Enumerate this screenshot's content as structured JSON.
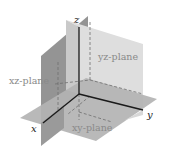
{
  "diagram": {
    "axes": {
      "x": "x",
      "y": "y",
      "z": "z"
    },
    "planes": {
      "xy": "xy-plane",
      "xz": "xz-plane",
      "yz": "yz-plane"
    },
    "colors": {
      "xz_plane": "#8e8e8e",
      "yz_plane": "#dcdcdc",
      "xy_plane": "#b4b4b4",
      "axis": "#1a1a1a",
      "label_gray": "#8a8a8a"
    }
  }
}
